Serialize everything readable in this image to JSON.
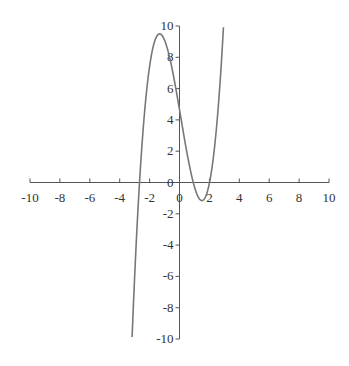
{
  "chart_data": {
    "type": "line",
    "title": "",
    "xlabel": "",
    "ylabel": "",
    "xlim": [
      -10,
      10
    ],
    "ylim": [
      -10,
      10
    ],
    "grid": false,
    "x_ticks": [
      -10,
      -8,
      -6,
      -4,
      -2,
      0,
      2,
      4,
      6,
      8,
      10
    ],
    "y_ticks": [
      -10,
      -8,
      -6,
      -4,
      -2,
      0,
      2,
      4,
      6,
      8,
      10
    ],
    "series": [
      {
        "name": "cubic",
        "description": "cubic curve with local max near (-1.3, 9.5) and local min near (1.5, -1.2)",
        "x": [
          -3.2,
          -3.0,
          -2.8,
          -2.5,
          -2.0,
          -1.5,
          -1.3,
          -1.0,
          -0.5,
          0,
          0.5,
          1.0,
          1.5,
          2.0,
          2.5,
          2.8
        ],
        "y": [
          -10,
          -6.3,
          -3.4,
          0.6,
          6.3,
          9.3,
          9.5,
          9.1,
          7.4,
          4.7,
          1.9,
          -0.1,
          -1.2,
          -0.5,
          2.7,
          6.0
        ]
      }
    ],
    "line_color": "#777777",
    "axis_color": "#555555"
  }
}
